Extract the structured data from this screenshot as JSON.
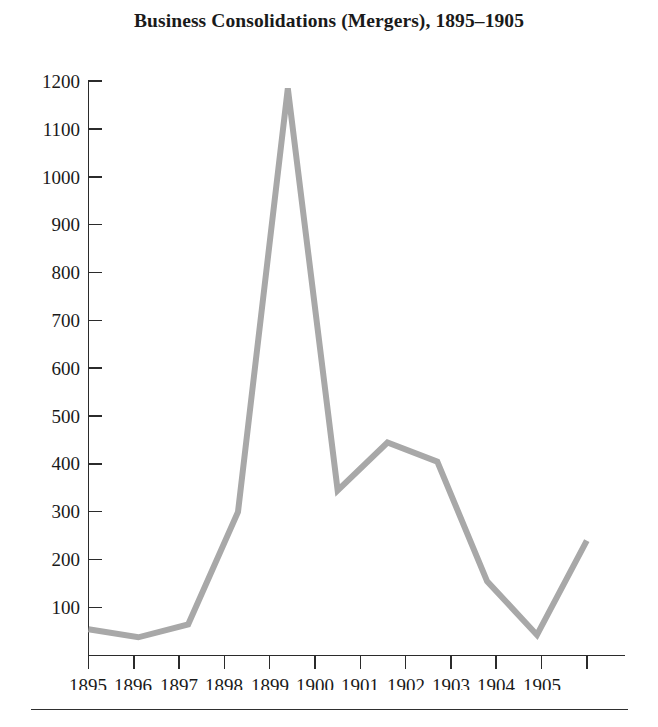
{
  "figure": {
    "title": "Business Consolidations (Mergers), 1895–1905",
    "background_color": "#ffffff",
    "axis_color": "#2b2b2b",
    "text_color": "#1a1a1a",
    "footer_rule": true
  },
  "chart_data": {
    "type": "line",
    "title": "Business Consolidations (Mergers), 1895–1905",
    "xlabel": "",
    "ylabel": "",
    "line_color": "#a8a8a8",
    "line_width": 6,
    "grid": false,
    "legend": "none",
    "xlim": [
      1895,
      1905
    ],
    "ylim": [
      0,
      1200
    ],
    "x_tick_labels": [
      "1895",
      "1896",
      "1897",
      "1898",
      "1899",
      "1900",
      "1901",
      "1902",
      "1903",
      "1904",
      "1905"
    ],
    "y_tick_labels": [
      "100",
      "200",
      "300",
      "400",
      "500",
      "600",
      "700",
      "800",
      "900",
      "1000",
      "1100",
      "1200"
    ],
    "y_ticks": [
      100,
      200,
      300,
      400,
      500,
      600,
      700,
      800,
      900,
      1000,
      1100,
      1200
    ],
    "categories": [
      "1895",
      "1896",
      "1897",
      "1898",
      "1899",
      "1900",
      "1901",
      "1902",
      "1903",
      "1904",
      "1905"
    ],
    "values": [
      55,
      38,
      65,
      300,
      1185,
      345,
      445,
      405,
      155,
      43,
      240
    ],
    "series": [
      {
        "name": "Business consolidations (mergers)",
        "x": [
          1895,
          1896,
          1897,
          1898,
          1899,
          1900,
          1901,
          1902,
          1903,
          1904,
          1905
        ],
        "values": [
          55,
          38,
          65,
          300,
          1185,
          345,
          445,
          405,
          155,
          43,
          240
        ]
      }
    ],
    "annotations": []
  }
}
